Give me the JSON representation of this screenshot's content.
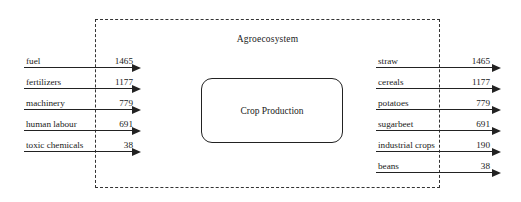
{
  "diagram": {
    "boundary_label": "Agroecosystem",
    "process_label": "Crop Production",
    "inputs": [
      {
        "label": "fuel",
        "value": "1465"
      },
      {
        "label": "fertilizers",
        "value": "1177"
      },
      {
        "label": "machinery",
        "value": "779"
      },
      {
        "label": "human labour",
        "value": "691"
      },
      {
        "label": "toxic chemicals",
        "value": "38"
      }
    ],
    "outputs": [
      {
        "label": "straw",
        "value": "1465"
      },
      {
        "label": "cereals",
        "value": "1177"
      },
      {
        "label": "potatoes",
        "value": "779"
      },
      {
        "label": "sugarbeet",
        "value": "691"
      },
      {
        "label": "industrial crops",
        "value": "190"
      },
      {
        "label": "beans",
        "value": "38"
      }
    ],
    "colors": {
      "line": "#222222",
      "boundary": "#333333",
      "text": "#1a1a1a",
      "background": "#ffffff"
    }
  }
}
